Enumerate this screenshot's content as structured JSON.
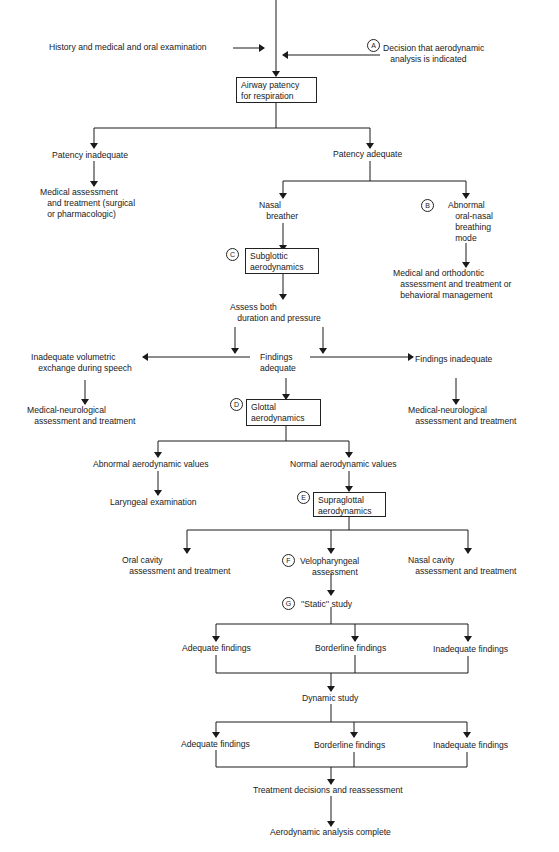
{
  "markers": {
    "A": "A",
    "B": "B",
    "C": "C",
    "D": "D",
    "E": "E",
    "F": "F",
    "G": "G"
  },
  "nodes": {
    "history": "History and medical and oral examination",
    "decision": "Decision that aerodynamic\n   analysis is indicated",
    "airway_box": "Airway patency\nfor respiration",
    "patency_inadequate": "Patency inadequate",
    "medical_assessment": "Medical assessment\n   and treatment (surgical\n   or pharmacologic)",
    "patency_adequate": "Patency adequate",
    "nasal_breather": "Nasal\n   breather",
    "abnormal_mode": "Abnormal\n   oral-nasal\n   breathing\n   mode",
    "subglottic_box": "Subglottic\naerodynamics",
    "medical_orthodontic": "Medical and orthodontic\n   assessment and treatment or\n   behavioral management",
    "assess_both": "Assess both\n   duration and pressure",
    "inadequate_volumetric": "Inadequate volumetric\n   exchange during speech",
    "findings_adequate": "Findings\nadequate",
    "findings_inadequate": "Findings inadequate",
    "med_neuro_left": "Medical-neurological\n   assessment and treatment",
    "med_neuro_right": "Medical-neurological\n   assessment and treatment",
    "glottal_box": "Glottal\naerodynamics",
    "abnormal_values": "Abnormal aerodynamic values",
    "normal_values": "Normal aerodynamic values",
    "laryngeal_exam": "Laryngeal examination",
    "supraglottal_box": "Supraglottal\naerodynamics",
    "oral_cavity": "Oral cavity\n   assessment and treatment",
    "velopharyngeal": "Velopharyngeal\n     assessment",
    "nasal_cavity": "Nasal cavity\n   assessment and treatment",
    "static_study": "''Static'' study",
    "static_adequate": "Adequate findings",
    "static_borderline": "Borderline findings",
    "static_inadequate": "Inadequate findings",
    "dynamic_study": "Dynamic study",
    "dynamic_adequate": "Adequate findings",
    "dynamic_borderline": "Borderline findings",
    "dynamic_inadequate": "Inadequate findings",
    "treatment_decisions": "Treatment decisions and reassessment",
    "complete": "Aerodynamic analysis complete"
  }
}
